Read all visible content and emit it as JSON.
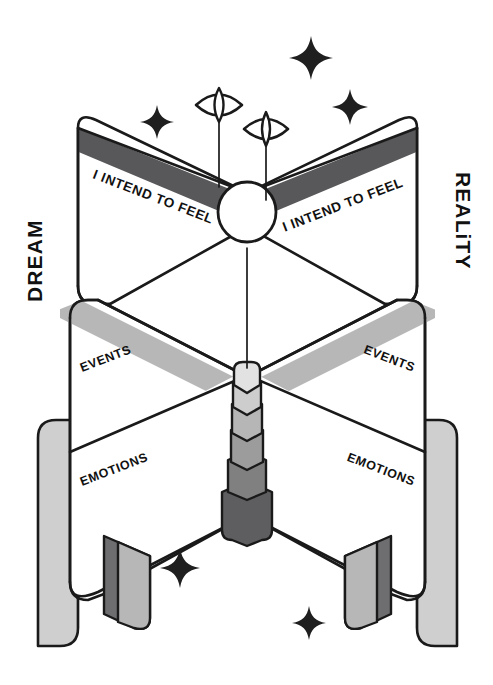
{
  "illustration": {
    "title": "Dream and Reality Intention Diagram",
    "background_color": "#ffffff"
  },
  "side_labels": {
    "left": "DREAM",
    "right": "REALiTY"
  },
  "panels": [
    {
      "id": "top-left",
      "label": "I INTEND TO FEEL",
      "band_color": "#58585a"
    },
    {
      "id": "top-right",
      "label": "I INTEND TO FEEL",
      "band_color": "#58585a"
    },
    {
      "id": "middle-left",
      "label": "EVENTS",
      "band_color": "#b7b7b7"
    },
    {
      "id": "middle-right",
      "label": "EVENTS",
      "band_color": "#b7b7b7"
    },
    {
      "id": "bottom-left",
      "label": "EMOTIONS",
      "band_color": "#ffffff"
    },
    {
      "id": "bottom-right",
      "label": "EMOTIONS",
      "band_color": "#ffffff"
    }
  ],
  "icons": {
    "eye_left": "eye-icon",
    "eye_right": "eye-icon",
    "hub": "hub-circle-icon",
    "column": "gradient-column-icon",
    "sparkles": [
      {
        "name": "sparkle-icon",
        "x": 157,
        "y": 122,
        "size": 17
      },
      {
        "name": "sparkle-icon",
        "x": 311,
        "y": 58,
        "size": 22
      },
      {
        "name": "sparkle-icon",
        "x": 350,
        "y": 107,
        "size": 18
      },
      {
        "name": "sparkle-icon",
        "x": 180,
        "y": 568,
        "size": 20
      },
      {
        "name": "sparkle-icon",
        "x": 309,
        "y": 623,
        "size": 17
      }
    ]
  },
  "palette": {
    "ink": "#1a1a1a",
    "white": "#ffffff",
    "band_dark": "#58585a",
    "band_light": "#b7b7b7",
    "leg_light": "#cfcfcf",
    "leg_mid": "#a9a9a9",
    "foot_dark": "#6e6e70",
    "column_1": "#e2e2e2",
    "column_2": "#cdcdcd",
    "column_3": "#b6b6b6",
    "column_4": "#9c9c9c",
    "column_5": "#808080",
    "column_base": "#5e5e60"
  },
  "column_segments": [
    {
      "tone": "#e2e2e2"
    },
    {
      "tone": "#cdcdcd"
    },
    {
      "tone": "#b6b6b6"
    },
    {
      "tone": "#9c9c9c"
    },
    {
      "tone": "#808080"
    },
    {
      "tone": "#5e5e60"
    }
  ]
}
